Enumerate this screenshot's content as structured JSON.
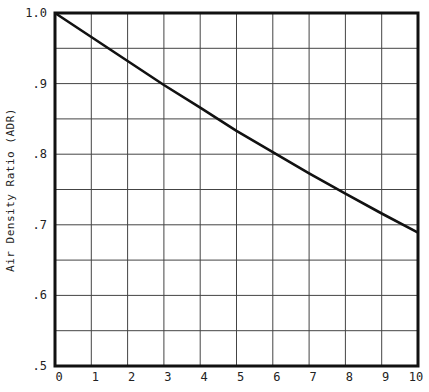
{
  "chart_data": {
    "type": "line",
    "title": "",
    "xlabel": "",
    "ylabel": "Air Density Ratio (ADR)",
    "xlim": [
      0,
      10
    ],
    "ylim": [
      0.5,
      1.0
    ],
    "grid": true,
    "legend": null,
    "x_ticks": [
      "0",
      "1",
      "2",
      "3",
      "4",
      "5",
      "6",
      "7",
      "8",
      "9",
      "10"
    ],
    "y_ticks": [
      ".5",
      ".6",
      ".7",
      ".8",
      ".9",
      "1.0"
    ],
    "y_tick_values": [
      0.5,
      0.6,
      0.7,
      0.8,
      0.9,
      1.0
    ],
    "y_gridlines": [
      0.5,
      0.55,
      0.6,
      0.65,
      0.7,
      0.75,
      0.8,
      0.85,
      0.9,
      0.95,
      1.0
    ],
    "series": [
      {
        "name": "Air Density Ratio",
        "x": [
          0,
          1,
          2,
          3,
          4,
          5,
          6,
          7,
          8,
          9,
          10
        ],
        "values": [
          1.0,
          0.966,
          0.932,
          0.898,
          0.866,
          0.833,
          0.803,
          0.773,
          0.744,
          0.716,
          0.689
        ]
      }
    ]
  },
  "axis": {
    "y_label": "Air Density Ratio (ADR)"
  }
}
